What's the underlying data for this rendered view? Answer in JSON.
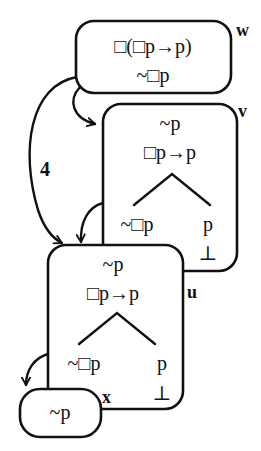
{
  "diagram": {
    "worlds": {
      "w": {
        "label": "w",
        "formulas": [
          "□(□p→p)",
          "~□p"
        ]
      },
      "v": {
        "label": "v",
        "formulas": [
          "~p",
          "□p→p"
        ],
        "branch_left": "~□p",
        "branch_right": "p",
        "branch_right_close": "⊥"
      },
      "u": {
        "label": "u",
        "formulas": [
          "~p",
          "□p→p"
        ],
        "branch_left": "~□p",
        "branch_right": "p",
        "branch_right_close": "⊥"
      },
      "x": {
        "label": "x",
        "formulas": [
          "~p"
        ]
      }
    },
    "arrows": [
      {
        "from": "w",
        "to": "v",
        "label": ""
      },
      {
        "from": "w",
        "to": "u",
        "label": "4"
      },
      {
        "from": "v",
        "to": "u",
        "label": ""
      },
      {
        "from": "u",
        "to": "x",
        "label": ""
      }
    ],
    "transitivity_label": "4"
  }
}
